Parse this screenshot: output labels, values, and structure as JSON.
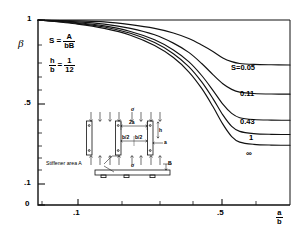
{
  "chart_data": {
    "type": "line",
    "title": "",
    "xlabel": "a/b",
    "ylabel": "β",
    "x_scale": "log",
    "xlim": [
      0.05,
      1.0
    ],
    "ylim": [
      0,
      1
    ],
    "x_ticks": [
      {
        "value": 0.1,
        "label": ".1"
      },
      {
        "value": 0.5,
        "label": ".5"
      }
    ],
    "y_ticks": [
      {
        "value": 0,
        "label": "0"
      },
      {
        "value": 0.1,
        "label": ".1"
      },
      {
        "value": 0.5,
        "label": ".5"
      },
      {
        "value": 1.0,
        "label": "1"
      }
    ],
    "grid": false,
    "legend_position": "inline-right-of-curve",
    "series": [
      {
        "name": "S=0.05",
        "label": "S=0.05",
        "S": 0.05,
        "points": [
          [
            0.05,
            1.0
          ],
          [
            0.08,
            0.995
          ],
          [
            0.11,
            0.99
          ],
          [
            0.15,
            0.975
          ],
          [
            0.2,
            0.955
          ],
          [
            0.25,
            0.93
          ],
          [
            0.3,
            0.9
          ],
          [
            0.35,
            0.865
          ],
          [
            0.4,
            0.83
          ],
          [
            0.45,
            0.795
          ],
          [
            0.5,
            0.775
          ],
          [
            0.55,
            0.765
          ],
          [
            0.65,
            0.76
          ],
          [
            0.8,
            0.758
          ],
          [
            1.0,
            0.757
          ]
        ]
      },
      {
        "name": "0.11",
        "label": "0.11",
        "S": 0.11,
        "points": [
          [
            0.05,
            1.0
          ],
          [
            0.08,
            0.99
          ],
          [
            0.11,
            0.978
          ],
          [
            0.15,
            0.955
          ],
          [
            0.2,
            0.92
          ],
          [
            0.25,
            0.875
          ],
          [
            0.3,
            0.825
          ],
          [
            0.35,
            0.765
          ],
          [
            0.4,
            0.705
          ],
          [
            0.45,
            0.655
          ],
          [
            0.5,
            0.625
          ],
          [
            0.55,
            0.61
          ],
          [
            0.65,
            0.603
          ],
          [
            0.8,
            0.6
          ],
          [
            1.0,
            0.599
          ]
        ]
      },
      {
        "name": "0.43",
        "label": "0.43",
        "S": 0.43,
        "points": [
          [
            0.05,
            1.0
          ],
          [
            0.08,
            0.985
          ],
          [
            0.11,
            0.968
          ],
          [
            0.15,
            0.938
          ],
          [
            0.2,
            0.893
          ],
          [
            0.25,
            0.838
          ],
          [
            0.3,
            0.775
          ],
          [
            0.35,
            0.7
          ],
          [
            0.4,
            0.62
          ],
          [
            0.45,
            0.545
          ],
          [
            0.5,
            0.495
          ],
          [
            0.55,
            0.472
          ],
          [
            0.65,
            0.462
          ],
          [
            0.8,
            0.459
          ],
          [
            1.0,
            0.458
          ]
        ]
      },
      {
        "name": "1",
        "label": "1",
        "S": 1,
        "points": [
          [
            0.05,
            1.0
          ],
          [
            0.08,
            0.982
          ],
          [
            0.11,
            0.962
          ],
          [
            0.15,
            0.928
          ],
          [
            0.2,
            0.878
          ],
          [
            0.25,
            0.818
          ],
          [
            0.3,
            0.748
          ],
          [
            0.35,
            0.665
          ],
          [
            0.4,
            0.575
          ],
          [
            0.45,
            0.487
          ],
          [
            0.5,
            0.425
          ],
          [
            0.55,
            0.398
          ],
          [
            0.65,
            0.386
          ],
          [
            0.8,
            0.382
          ],
          [
            1.0,
            0.381
          ]
        ]
      },
      {
        "name": "∞",
        "label": "∞",
        "S": "∞",
        "points": [
          [
            0.05,
            1.0
          ],
          [
            0.08,
            0.978
          ],
          [
            0.11,
            0.955
          ],
          [
            0.15,
            0.918
          ],
          [
            0.2,
            0.862
          ],
          [
            0.25,
            0.797
          ],
          [
            0.3,
            0.72
          ],
          [
            0.35,
            0.63
          ],
          [
            0.4,
            0.532
          ],
          [
            0.45,
            0.437
          ],
          [
            0.5,
            0.37
          ],
          [
            0.55,
            0.34
          ],
          [
            0.65,
            0.328
          ],
          [
            0.8,
            0.324
          ],
          [
            1.0,
            0.323
          ]
        ]
      }
    ]
  },
  "axes": {
    "y_label": "β",
    "x_label_num": "a",
    "x_label_den": "b"
  },
  "annotations": {
    "eq1_lhs": "S =",
    "eq1_num": "A",
    "eq1_den": "bB",
    "eq2_num": "h",
    "eq2_den": "b",
    "eq2_eq": "=",
    "eq2_rnum": "1",
    "eq2_rden": "12"
  },
  "inset": {
    "stiffener_label": "Stiffener area A",
    "dim_2a": "2a",
    "dim_b_half_left": "b/2",
    "dim_b_half_right": "b/2",
    "dim_h": "h",
    "dim_a": "a",
    "dim_B": "B",
    "stress_top": "σ",
    "stress_bottom": "σ"
  }
}
